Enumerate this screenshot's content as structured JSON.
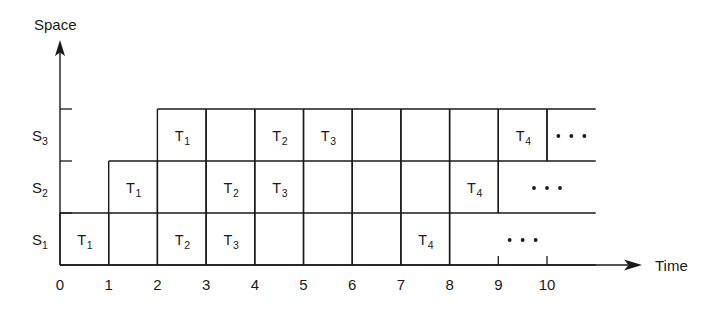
{
  "figure": {
    "type": "space-time-pipeline-diagram",
    "y_axis": {
      "label": "Space",
      "arrow": true,
      "categories": [
        "S1",
        "S2",
        "S3"
      ],
      "tick_labels": [
        {
          "base": "S",
          "sub": "1"
        },
        {
          "base": "S",
          "sub": "2"
        },
        {
          "base": "S",
          "sub": "3"
        }
      ]
    },
    "x_axis": {
      "label": "Time",
      "arrow": true,
      "ticks": [
        "0",
        "1",
        "2",
        "3",
        "4",
        "5",
        "6",
        "7",
        "8",
        "9",
        "10"
      ]
    },
    "ellipsis": "· · ·",
    "colors": {
      "line": "#1a1a1a",
      "text": "#1a1a1a",
      "background": "#ffffff"
    },
    "rows": [
      {
        "name": "S3",
        "row_index": 2,
        "start_time": 2,
        "end_time": 11,
        "cells": [
          {
            "start": 2,
            "end": 3,
            "base": "T",
            "sub": "1"
          },
          {
            "start": 3,
            "end": 4,
            "base": "",
            "sub": ""
          },
          {
            "start": 4,
            "end": 5,
            "base": "T",
            "sub": "2"
          },
          {
            "start": 5,
            "end": 6,
            "base": "T",
            "sub": "3"
          },
          {
            "start": 6,
            "end": 7,
            "base": "",
            "sub": ""
          },
          {
            "start": 7,
            "end": 8,
            "base": "",
            "sub": ""
          },
          {
            "start": 8,
            "end": 9,
            "base": "",
            "sub": ""
          },
          {
            "start": 9,
            "end": 10,
            "base": "T",
            "sub": "4"
          },
          {
            "start": 10,
            "end": 11,
            "base": "ellipsis",
            "sub": ""
          }
        ]
      },
      {
        "name": "S2",
        "row_index": 1,
        "start_time": 1,
        "end_time": 11,
        "cells": [
          {
            "start": 1,
            "end": 2,
            "base": "T",
            "sub": "1"
          },
          {
            "start": 2,
            "end": 3,
            "base": "",
            "sub": ""
          },
          {
            "start": 3,
            "end": 4,
            "base": "T",
            "sub": "2"
          },
          {
            "start": 4,
            "end": 5,
            "base": "T",
            "sub": "3"
          },
          {
            "start": 5,
            "end": 6,
            "base": "",
            "sub": ""
          },
          {
            "start": 6,
            "end": 7,
            "base": "",
            "sub": ""
          },
          {
            "start": 7,
            "end": 8,
            "base": "",
            "sub": ""
          },
          {
            "start": 8,
            "end": 9,
            "base": "T",
            "sub": "4"
          },
          {
            "start": 9,
            "end": 11,
            "base": "ellipsis",
            "sub": ""
          }
        ]
      },
      {
        "name": "S1",
        "row_index": 0,
        "start_time": 0,
        "end_time": 11,
        "cells": [
          {
            "start": 0,
            "end": 1,
            "base": "T",
            "sub": "1"
          },
          {
            "start": 1,
            "end": 2,
            "base": "",
            "sub": ""
          },
          {
            "start": 2,
            "end": 3,
            "base": "T",
            "sub": "2"
          },
          {
            "start": 3,
            "end": 4,
            "base": "T",
            "sub": "3"
          },
          {
            "start": 4,
            "end": 5,
            "base": "",
            "sub": ""
          },
          {
            "start": 5,
            "end": 6,
            "base": "",
            "sub": ""
          },
          {
            "start": 6,
            "end": 7,
            "base": "",
            "sub": ""
          },
          {
            "start": 7,
            "end": 8,
            "base": "T",
            "sub": "4"
          },
          {
            "start": 8,
            "end": 11,
            "base": "ellipsis",
            "sub": ""
          }
        ]
      }
    ]
  },
  "geometry": {
    "origin_x": 60,
    "origin_y": 265,
    "unit_w": 48.7,
    "row_h": 52,
    "y_axis_top": 48,
    "x_axis_right": 640,
    "grid_right": 607
  }
}
